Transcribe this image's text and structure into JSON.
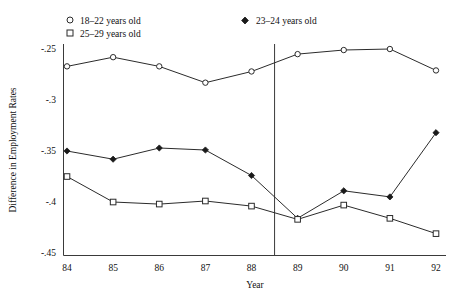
{
  "chart_data": {
    "type": "line",
    "title": "",
    "xlabel": "Year",
    "ylabel": "Difference in Employment Rates",
    "x": [
      84,
      85,
      86,
      87,
      88,
      89,
      90,
      91,
      92
    ],
    "xtick_labels": [
      "84",
      "85",
      "86",
      "87",
      "88",
      "89",
      "90",
      "91",
      "92"
    ],
    "ytick_labels": [
      "-.25",
      "-.3",
      "-.35",
      "-.4",
      "-.45"
    ],
    "ytick_values": [
      -0.25,
      -0.3,
      -0.35,
      -0.4,
      -0.45
    ],
    "xlim": [
      83.6,
      92.4
    ],
    "ylim": [
      -0.46,
      -0.235
    ],
    "grid": false,
    "legend_position": "top",
    "annotations": [
      {
        "name": "vertical-reference-line",
        "type": "vline",
        "x": 88.5
      }
    ],
    "series": [
      {
        "name": "18–22 years old",
        "marker": "open-circle",
        "values": [
          -0.268,
          -0.259,
          -0.268,
          -0.284,
          -0.273,
          -0.256,
          -0.252,
          -0.251,
          -0.272
        ]
      },
      {
        "name": "23–24 years old",
        "marker": "filled-diamond",
        "values": [
          -0.351,
          -0.359,
          -0.348,
          -0.35,
          -0.375,
          -0.417,
          -0.39,
          -0.396,
          -0.333
        ]
      },
      {
        "name": "25–29 years old",
        "marker": "open-square",
        "values": [
          -0.376,
          -0.401,
          -0.403,
          -0.4,
          -0.405,
          -0.418,
          -0.404,
          -0.417,
          -0.432
        ]
      }
    ]
  },
  "legend": {
    "entries": [
      {
        "label": "18–22 years old",
        "marker": "open-circle"
      },
      {
        "label": "25–29 years old",
        "marker": "open-square"
      },
      {
        "label": "23–24 years old",
        "marker": "filled-diamond"
      }
    ]
  },
  "axes": {
    "y_title": "Difference in Employment Rates",
    "x_title": "Year"
  },
  "colors": {
    "line": "#2b2b2b",
    "frame": "#3a3a3a",
    "text": "#111111",
    "background": "#ffffff"
  }
}
